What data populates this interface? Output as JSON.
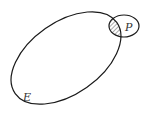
{
  "diagram": {
    "sets": [
      {
        "id": "E",
        "label": "E"
      },
      {
        "id": "P",
        "label": "P"
      }
    ],
    "shaded_region": "E ∩ P",
    "colors": {
      "stroke": "#1a1a1a",
      "hatch": "#555555",
      "background": "#ffffff",
      "label": "#333333"
    }
  }
}
